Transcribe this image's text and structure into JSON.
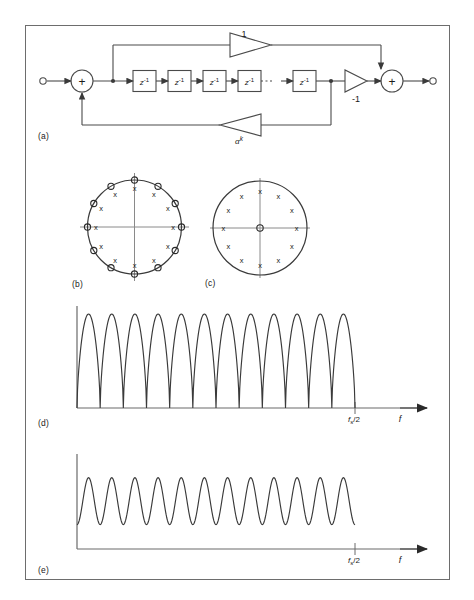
{
  "figure": {
    "panels": [
      {
        "id": "a",
        "label": "(a)",
        "caption_role": "block-diagram"
      },
      {
        "id": "b",
        "label": "(b)",
        "caption_role": "pole-zero-plot"
      },
      {
        "id": "c",
        "label": "(c)",
        "caption_role": "pole-zero-plot"
      },
      {
        "id": "d",
        "label": "(d)",
        "caption_role": "magnitude-response"
      },
      {
        "id": "e",
        "label": "(e)",
        "caption_role": "magnitude-response"
      }
    ],
    "colors": {
      "ink": "#1a1a1a",
      "line": "#4a4a4a",
      "frame": "#6d6d6d",
      "axis": "#6a6a6a",
      "background": "#ffffff"
    }
  },
  "block_diagram": {
    "input_node": "o",
    "output_node": "o",
    "adder_symbol": "+",
    "delay_label_base": "z",
    "delay_label_exp": "-1",
    "delay_count_visible": 5,
    "delay_ellipsis": "····",
    "feedforward_gain": "1",
    "output_gain": "-1",
    "feedback_gain_base": "α",
    "feedback_gain_exp": "k",
    "summers": [
      "+",
      "+"
    ]
  },
  "pole_zero_b": {
    "type": "pole-zero",
    "unit_circle": true,
    "zero_symbol": "o",
    "pole_symbol": "x",
    "zero_count": 12,
    "pole_count": 12,
    "zero_radius": 1.0,
    "pole_radius": 0.82,
    "angles_deg": [
      0,
      30,
      60,
      90,
      120,
      150,
      180,
      210,
      240,
      270,
      300,
      330
    ],
    "origin_marker": "none",
    "axes_shown": true
  },
  "pole_zero_c": {
    "type": "pole-zero",
    "unit_circle": true,
    "zero_symbol": "o",
    "pole_symbol": "x",
    "zero_count": 1,
    "pole_count": 12,
    "zero_radius": 0.0,
    "pole_radius": 0.78,
    "angles_deg": [
      0,
      30,
      60,
      90,
      120,
      150,
      180,
      210,
      240,
      270,
      300,
      330
    ],
    "origin_marker": "zero-at-origin",
    "axes_shown": true
  },
  "chart_data": [
    {
      "type": "line",
      "panel": "d",
      "title": "",
      "xlabel": "f",
      "ylabel": "",
      "xlim": [
        0,
        1
      ],
      "ylim": [
        0,
        1
      ],
      "grid": false,
      "legend": null,
      "tick_labels": [
        "f_s/2"
      ],
      "tick_label_text": "fₛ/2",
      "axis_arrow": true,
      "lobe_count": 12,
      "minimum_value": 0.0,
      "peak_value": 1.0,
      "description": "comb filter magnitude response with deep nulls reaching zero",
      "x": [
        0,
        0.02,
        0.042,
        0.062,
        0.083,
        0.104,
        0.125,
        0.146,
        0.167,
        0.188,
        0.208,
        0.229,
        0.25,
        0.271,
        0.292,
        0.312,
        0.333,
        0.354,
        0.375,
        0.396,
        0.417,
        0.438,
        0.458,
        0.479,
        0.5,
        0.521,
        0.542,
        0.562,
        0.583,
        0.604,
        0.625,
        0.646,
        0.667,
        0.688,
        0.708,
        0.729,
        0.75,
        0.771,
        0.792,
        0.812,
        0.833,
        0.854,
        0.875,
        0.896,
        0.917,
        0.938,
        0.958,
        0.979,
        1.0
      ],
      "values": [
        0.0,
        1.0,
        0.0,
        1.0,
        0.0,
        1.0,
        0.0,
        1.0,
        0.0,
        1.0,
        0.0,
        1.0,
        0.0,
        1.0,
        0.0,
        1.0,
        0.0,
        1.0,
        0.0,
        1.0,
        0.0,
        1.0,
        0.0,
        1.0,
        0.0,
        1.0,
        0.0,
        1.0,
        0.0,
        1.0,
        0.0,
        1.0,
        0.0,
        1.0,
        0.0,
        1.0,
        0.0,
        1.0,
        0.0,
        1.0,
        0.0,
        1.0,
        0.0,
        1.0,
        0.0,
        1.0,
        0.0,
        1.0,
        0.0
      ]
    },
    {
      "type": "line",
      "panel": "e",
      "title": "",
      "xlabel": "f",
      "ylabel": "",
      "xlim": [
        0,
        1
      ],
      "ylim": [
        0,
        1
      ],
      "grid": false,
      "legend": null,
      "tick_labels": [
        "f_s/2"
      ],
      "tick_label_text": "fₛ/2",
      "axis_arrow": true,
      "lobe_count": 12,
      "minimum_value": 0.28,
      "peak_value": 0.82,
      "description": "ripple magnitude response with non-zero minima",
      "x": [
        0,
        0.02,
        0.042,
        0.062,
        0.083,
        0.104,
        0.125,
        0.146,
        0.167,
        0.188,
        0.208,
        0.229,
        0.25,
        0.271,
        0.292,
        0.312,
        0.333,
        0.354,
        0.375,
        0.396,
        0.417,
        0.438,
        0.458,
        0.479,
        0.5,
        0.521,
        0.542,
        0.562,
        0.583,
        0.604,
        0.625,
        0.646,
        0.667,
        0.688,
        0.708,
        0.729,
        0.75,
        0.771,
        0.792,
        0.812,
        0.833,
        0.854,
        0.875,
        0.896,
        0.917,
        0.938,
        0.958,
        0.979,
        1.0
      ],
      "values": [
        0.82,
        0.28,
        0.82,
        0.28,
        0.82,
        0.28,
        0.82,
        0.28,
        0.82,
        0.28,
        0.82,
        0.28,
        0.82,
        0.28,
        0.82,
        0.28,
        0.82,
        0.28,
        0.82,
        0.28,
        0.82,
        0.28,
        0.82,
        0.28,
        0.82,
        0.28,
        0.82,
        0.28,
        0.82,
        0.28,
        0.82,
        0.28,
        0.82,
        0.28,
        0.82,
        0.28,
        0.82,
        0.28,
        0.82,
        0.28,
        0.82,
        0.28,
        0.82,
        0.28,
        0.82,
        0.28,
        0.82,
        0.28,
        0.82
      ]
    }
  ]
}
